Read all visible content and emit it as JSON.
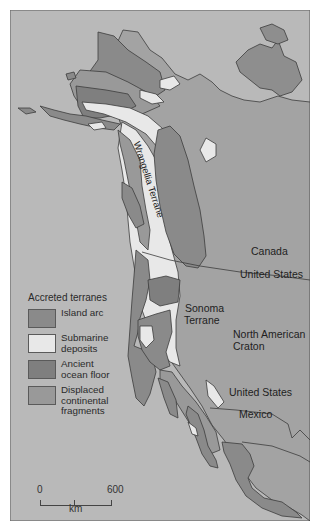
{
  "map": {
    "colors": {
      "ocean": "#b9b9b9",
      "craton": "#a3a3a3",
      "island_arc": "#8a8a8a",
      "submarine_deposits": "#e8e8e8",
      "ancient_ocean_floor": "#7f7f7f",
      "displaced_continental_fragments": "#999999",
      "outline": "#3c3c3c",
      "frame": "#6a6a6a"
    },
    "labels": {
      "wrangellia": "Wrangellia Terrane",
      "canada": "Canada",
      "united_states_north": "United States",
      "sonoma_line1": "Sonoma",
      "sonoma_line2": "Terrane",
      "craton_line1": "North American",
      "craton_line2": "Craton",
      "united_states_south": "United States",
      "mexico": "Mexico"
    },
    "legend": {
      "title": "Accreted terranes",
      "items": [
        {
          "label": "Island arc",
          "color": "#8a8a8a"
        },
        {
          "label": "Submarine deposits",
          "line1": "Submarine",
          "line2": "deposits",
          "color": "#e8e8e8"
        },
        {
          "label": "Ancient ocean floor",
          "line1": "Ancient",
          "line2": "ocean floor",
          "color": "#7f7f7f"
        },
        {
          "label": "Displaced continental fragments",
          "line1": "Displaced",
          "line2": "continental",
          "line3": "fragments",
          "color": "#999999"
        }
      ]
    },
    "scale": {
      "start": "0",
      "end": "600",
      "unit": "km"
    }
  }
}
